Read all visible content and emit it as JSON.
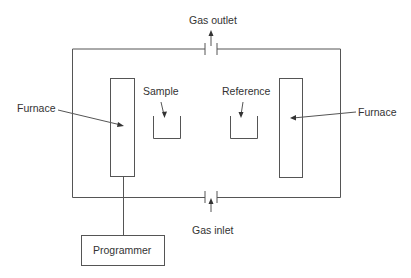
{
  "diagram": {
    "labels": {
      "gas_outlet": "Gas outlet",
      "gas_inlet": "Gas inlet",
      "sample": "Sample",
      "reference": "Reference",
      "furnace_left": "Furnace",
      "furnace_right": "Furnace",
      "programmer": "Programmer"
    },
    "colors": {
      "stroke": "#555555",
      "text": "#333333",
      "background": "#ffffff"
    }
  }
}
